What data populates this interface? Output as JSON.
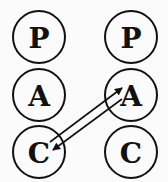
{
  "diagram": {
    "type": "transactional-analysis-ego-states",
    "left_person": {
      "states": [
        {
          "label": "P",
          "cx": 39,
          "cy": 37
        },
        {
          "label": "A",
          "cx": 39,
          "cy": 95
        },
        {
          "label": "C",
          "cx": 39,
          "cy": 152
        }
      ]
    },
    "right_person": {
      "states": [
        {
          "label": "P",
          "cx": 131,
          "cy": 37
        },
        {
          "label": "A",
          "cx": 131,
          "cy": 95
        },
        {
          "label": "C",
          "cx": 131,
          "cy": 152
        }
      ]
    },
    "radius": 26,
    "transactions": [
      {
        "from": "left.C",
        "to": "right.A",
        "x1": 50,
        "y1": 142,
        "x2": 122,
        "y2": 88
      },
      {
        "from": "right.A",
        "to": "left.C",
        "x1": 122,
        "y1": 99,
        "x2": 53,
        "y2": 150
      }
    ],
    "colors": {
      "stroke": "#111111",
      "background": "#fbfbfb"
    }
  }
}
